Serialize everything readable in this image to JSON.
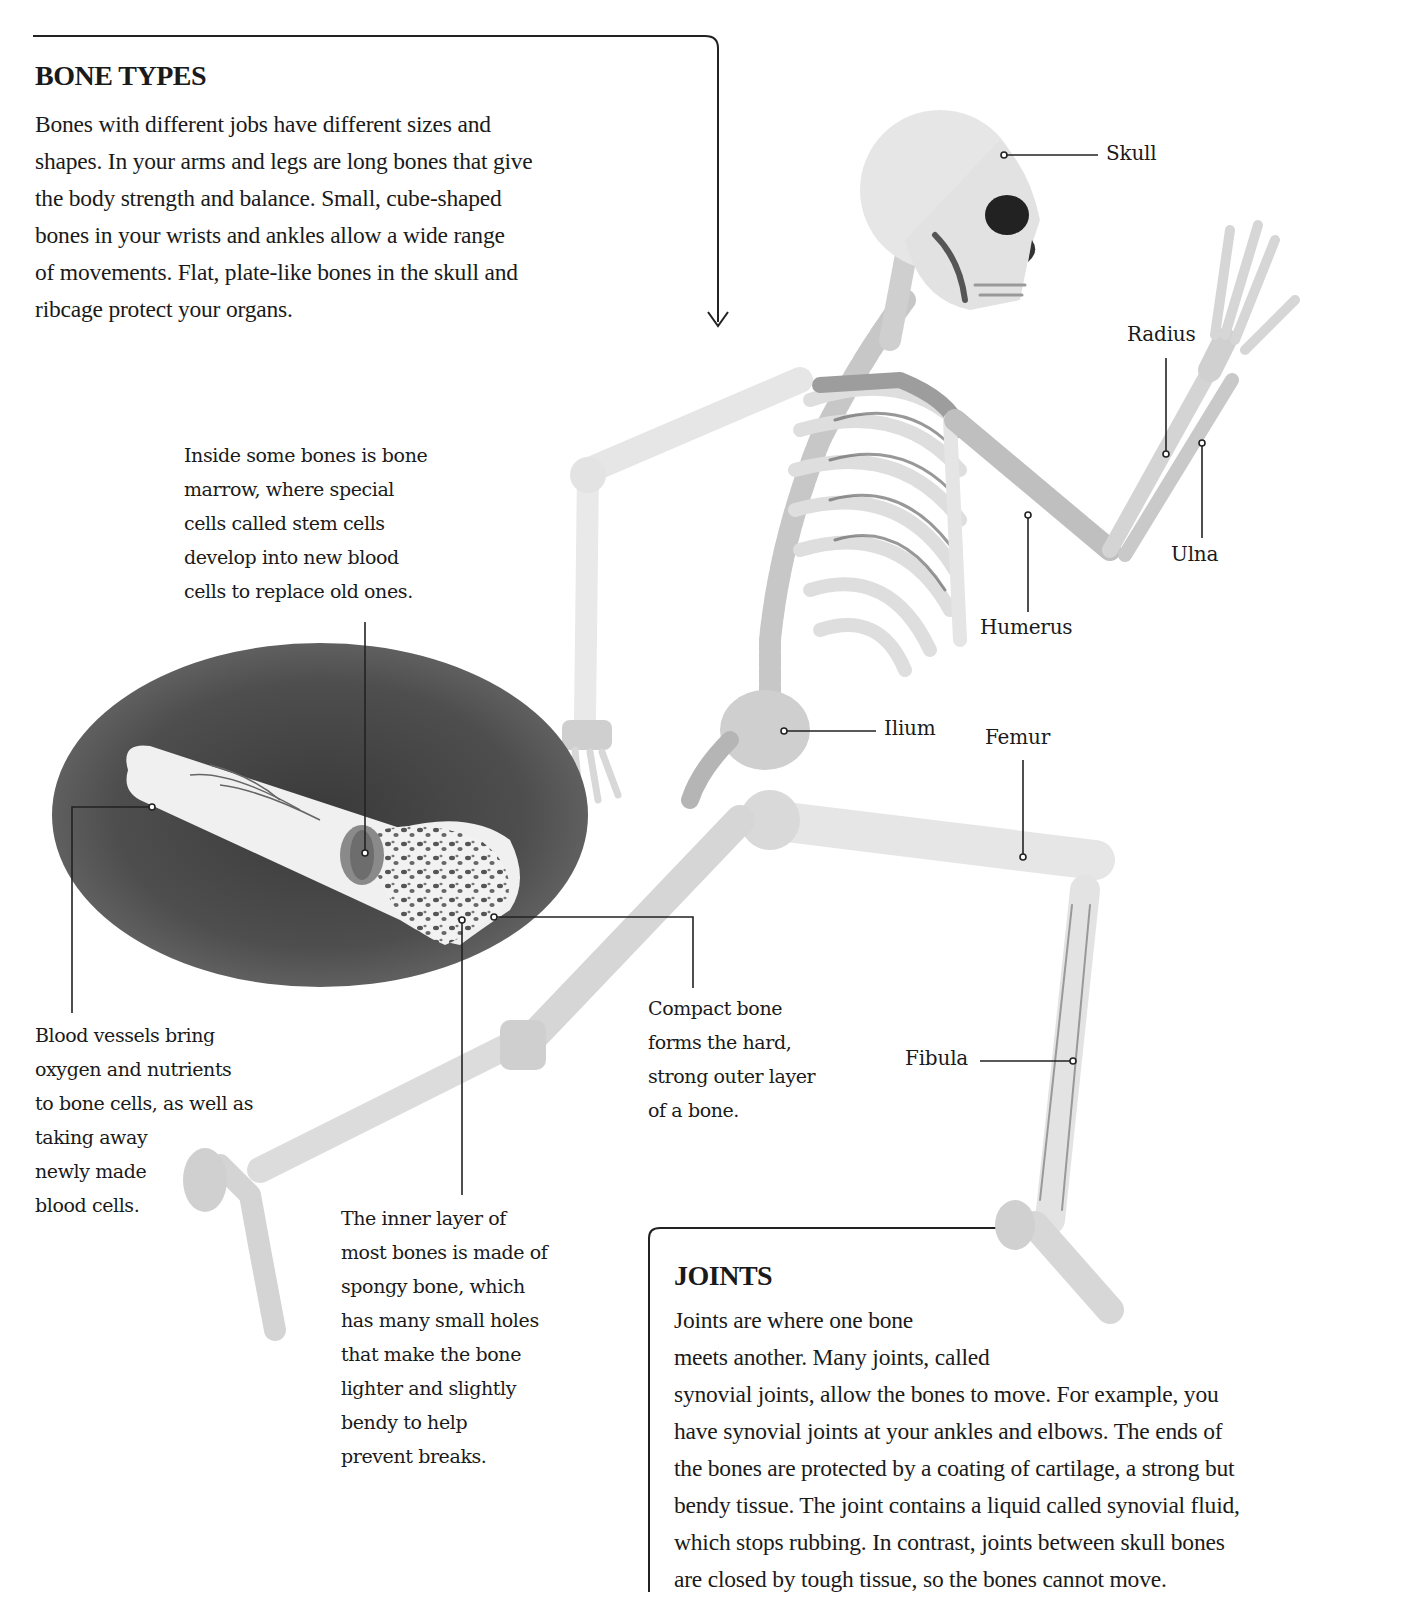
{
  "bone_types": {
    "title": "BONE TYPES",
    "lines": [
      "Bones with different jobs have different sizes and",
      "shapes. In your arms and legs are long bones that give",
      "the body strength and balance. Small, cube-shaped",
      "bones in your wrists and ankles allow a wide range",
      "of movements. Flat, plate-like bones in the skull and",
      "ribcage protect your organs."
    ]
  },
  "captions": {
    "marrow": [
      "Inside some bones is bone",
      "marrow, where special",
      "cells called stem cells",
      "develop into new blood",
      "cells to replace old ones."
    ],
    "blood_vessels": [
      "Blood vessels bring",
      "oxygen and nutrients",
      "to bone cells, as well as",
      "taking away",
      "newly made",
      "blood cells."
    ],
    "spongy_bone": [
      "The inner layer of",
      "most bones is made of",
      "spongy bone, which",
      "has many small holes",
      "that make the bone",
      "lighter and slightly",
      "bendy to help",
      "prevent breaks."
    ],
    "compact_bone": [
      "Compact bone",
      "forms the hard,",
      "strong outer layer",
      "of a bone."
    ]
  },
  "bone_labels": {
    "skull": "Skull",
    "radius": "Radius",
    "ulna": "Ulna",
    "humerus": "Humerus",
    "ilium": "Ilium",
    "femur": "Femur",
    "fibula": "Fibula"
  },
  "joints": {
    "title": "JOINTS",
    "lines": [
      "Joints are where one bone",
      "meets another. Many joints, called",
      "synovial joints, allow the bones to move. For example, you",
      "have synovial joints at your ankles and elbows. The ends of",
      "the bones are protected by a coating of cartilage, a strong but",
      "bendy tissue. The joint contains a liquid called synovial fluid,",
      "which stops rubbing. In contrast, joints between skull bones",
      "are closed by tough tissue, so the bones cannot move."
    ]
  },
  "colors": {
    "text": "#1a1a1a",
    "bone_light": "#e4e4e4",
    "bone_mid": "#bdbdbd",
    "bone_dark": "#7a7a7a",
    "ellipse_bg": "#5a5a5a"
  }
}
